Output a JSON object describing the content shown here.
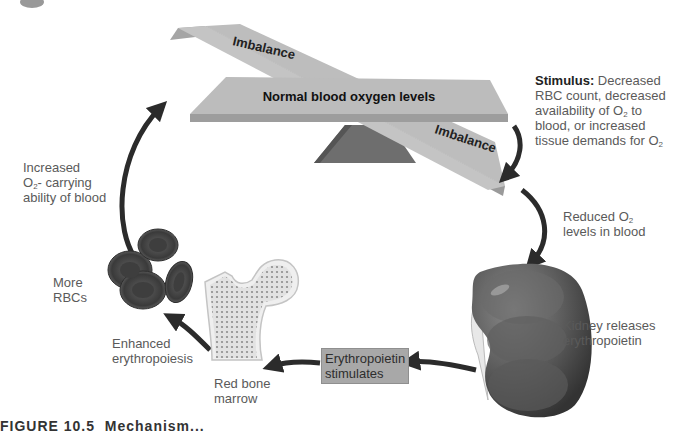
{
  "scale": {
    "top_beam_label": "Imbalance",
    "main_beam_label": "Normal blood oxygen levels",
    "bottom_beam_label": "Imbalance"
  },
  "labels": {
    "stimulus_title": "Stimulus:",
    "stimulus_line1": " Decreased",
    "stimulus_line2": "RBC count, decreased",
    "stimulus_line3a": "availability of O",
    "stimulus_line3b": "2",
    "stimulus_line3c": " to",
    "stimulus_line4": "blood, or  increased",
    "stimulus_line5a": "tissue demands for O",
    "stimulus_line5b": "2",
    "reduced_line1a": "Reduced O",
    "reduced_line1b": "2",
    "reduced_line2": "levels in blood",
    "kidney_line1": "Kidney releases",
    "kidney_line2": "erythropoietin",
    "epo_line1": "Erythropoietin",
    "epo_line2": "stimulates",
    "marrow_line1": "Red bone",
    "marrow_line2": "marrow",
    "enhanced_line1": "Enhanced",
    "enhanced_line2": "erythropoiesis",
    "more_line1": "More",
    "more_line2": "RBCs",
    "increased_line1": "Increased",
    "increased_line2a": "O",
    "increased_line2b": "2",
    "increased_line2c": "- carrying",
    "increased_line3": "ability of blood"
  },
  "caption": {
    "figure_label": "FIGURE 10.5",
    "title": "Mechanism..."
  },
  "colors": {
    "beam_face": "#b9b9b9",
    "beam_edge": "#9a9a9a",
    "fulcrum": "#6e6e6e",
    "arrow": "#2b2b2b",
    "kidney": "#5a5a5a",
    "rbc": "#4a4a4a",
    "box": "#a8a8a8"
  }
}
